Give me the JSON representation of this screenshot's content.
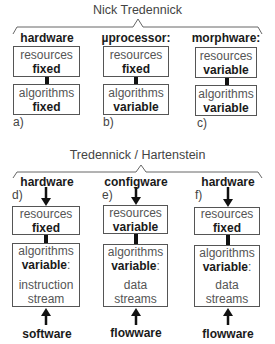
{
  "top": {
    "title": "Nick Tredennick",
    "columns": [
      {
        "header": "hardware",
        "resources_label": "resources",
        "resources_value": "fixed",
        "algorithms_label": "algorithms",
        "algorithms_value": "fixed",
        "tag": "a)"
      },
      {
        "header": "µprocessor:",
        "resources_label": "resources",
        "resources_value": "fixed",
        "algorithms_label": "algorithms",
        "algorithms_value": "variable",
        "tag": "b)"
      },
      {
        "header": "morphware:",
        "resources_label": "resources",
        "resources_value": "variable",
        "algorithms_label": "algorithms",
        "algorithms_value": "variable",
        "tag": "c)"
      }
    ]
  },
  "bottom": {
    "title": "Tredennick / Hartenstein",
    "columns": [
      {
        "header": "hardware",
        "tag": "d)",
        "resources_label": "resources",
        "resources_value": "fixed",
        "algorithms_label": "algorithms",
        "algorithms_value": "variable",
        "algorithms_colon": ":",
        "stream_line1": "instruction",
        "stream_line2": "stream",
        "footer": "software"
      },
      {
        "header": "configware",
        "tag": "e)",
        "resources_label": "resources",
        "resources_value": "variable",
        "algorithms_label": "algorithms",
        "algorithms_value": "variable",
        "algorithms_colon": ":",
        "stream_line1": "data",
        "stream_line2": "streams",
        "footer": "flowware"
      },
      {
        "header": "hardware",
        "tag": "f)",
        "resources_label": "resources",
        "resources_value": "fixed",
        "algorithms_label": "algorithms",
        "algorithms_value": "variable",
        "algorithms_colon": ":",
        "stream_line1": "data",
        "stream_line2": "streams",
        "footer": "flowware"
      }
    ]
  },
  "colors": {
    "border": "#555555",
    "connector": "#111111",
    "text_light": "#555555",
    "text_bold": "#1a1a1a"
  }
}
